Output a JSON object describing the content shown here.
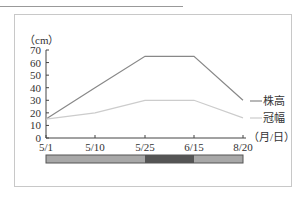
{
  "chart_data": {
    "type": "line",
    "title": "",
    "ylabel": "（cm）",
    "xlabel": "（月/日）",
    "categories": [
      "5/1",
      "5/10",
      "5/25",
      "6/15",
      "8/20"
    ],
    "ylim": [
      0,
      70
    ],
    "yticks": [
      0,
      10,
      20,
      30,
      40,
      50,
      60,
      70
    ],
    "grid": false,
    "legend_position": "right",
    "series": [
      {
        "name": "株高",
        "values": [
          15,
          40,
          65,
          65,
          30
        ],
        "color": "#888888"
      },
      {
        "name": "冠幅",
        "values": [
          15,
          20,
          30,
          30,
          16
        ],
        "color": "#cccccc"
      }
    ],
    "phase_bar": {
      "segments": [
        {
          "from": "5/1",
          "to": "5/25",
          "color": "#a8a8a8"
        },
        {
          "from": "5/25",
          "to": "6/15",
          "color": "#555555"
        },
        {
          "from": "6/15",
          "to": "8/20",
          "color": "#a8a8a8"
        }
      ]
    }
  }
}
